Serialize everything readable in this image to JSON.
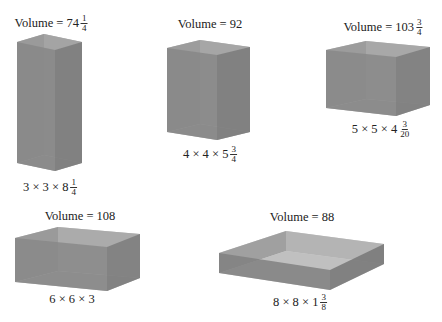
{
  "boxes": [
    {
      "id": "box1",
      "volume_label": "Volume = 74",
      "volume_frac": {
        "num": "1",
        "den": "4"
      },
      "dims_label": "3 × 3 × 8",
      "dims_frac": {
        "num": "1",
        "den": "4"
      }
    },
    {
      "id": "box2",
      "volume_label": "Volume = 92",
      "volume_frac": null,
      "dims_label": "4 × 4 × 5",
      "dims_frac": {
        "num": "3",
        "den": "4"
      }
    },
    {
      "id": "box3",
      "volume_label": "Volume = 103",
      "volume_frac": {
        "num": "3",
        "den": "4"
      },
      "dims_label": "5 × 5 × 4",
      "dims_frac": {
        "num": "3",
        "den": "20"
      }
    },
    {
      "id": "box4",
      "volume_label": "Volume = 108",
      "volume_frac": null,
      "dims_label": "6 × 6 × 3",
      "dims_frac": null
    },
    {
      "id": "box5",
      "volume_label": "Volume = 88",
      "volume_frac": null,
      "dims_label": "8 × 8 × 1",
      "dims_frac": {
        "num": "3",
        "den": "8"
      }
    }
  ],
  "colors": {
    "front": "#8c8c8c",
    "side": "#7a7a7a",
    "inner_back": "#a9a9a9",
    "floor": "#9e9e9e",
    "rim": "#c8c8c8"
  }
}
